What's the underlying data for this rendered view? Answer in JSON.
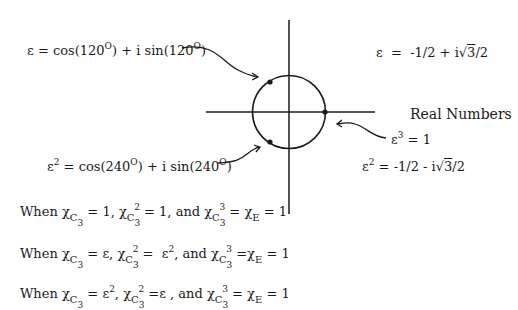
{
  "diagram": {
    "labels": {
      "eps_polar": {
        "lhs": "ε",
        "eq": " = cos(120",
        "deg": "O",
        "mid": ") + i sin(120",
        "deg2": "O",
        "end": ")"
      },
      "eps_rect": {
        "lhs": "ε",
        "rhs": "  =  -1/2 + i",
        "root": "3",
        "tail": "/2"
      },
      "real_axis": "Real Numbers",
      "eps_cubed": {
        "base": "ε",
        "exp": "3",
        "rhs": " = 1"
      },
      "eps2_rect": {
        "base": "ε",
        "exp": "2",
        "rhs": " = -1/2 - i",
        "root": "3",
        "tail": "/2"
      },
      "eps2_polar": {
        "base": "ε",
        "exp": "2",
        "eq": " = cos(240",
        "deg": "O",
        "mid": ") + i sin(240",
        "deg2": "O",
        "end": ")"
      }
    },
    "rows": [
      {
        "when": "When ",
        "chi": "χ",
        "C": "C",
        "sub": "3",
        "v1": " = 1, ",
        "v2": " = 1, and ",
        "v3": " = ",
        "E": "E",
        "end": " = 1",
        "exp2": "2",
        "exp3": "3"
      },
      {
        "when": "When ",
        "chi": "χ",
        "C": "C",
        "sub": "3",
        "v1": " = ε, ",
        "v2": " =  ε",
        "v2exp": "2",
        "v2b": ", and ",
        "v3": " =",
        "E": "E",
        "end": " = 1",
        "exp2": "2",
        "exp3": "3"
      },
      {
        "when": "When ",
        "chi": "χ",
        "C": "C",
        "sub": "3",
        "v1": " = ε",
        "v1exp": "2",
        "v1b": ", ",
        "v2": " =ε , and ",
        "v3": " = ",
        "E": "E",
        "end": " = 1",
        "exp2": "2",
        "exp3": "3"
      }
    ],
    "geometry": {
      "center": [
        289,
        112
      ],
      "radius": 36,
      "points_deg": [
        0,
        120,
        240
      ]
    },
    "colors": {
      "ink": "#1a1a1a",
      "background": "#ffffff"
    }
  }
}
